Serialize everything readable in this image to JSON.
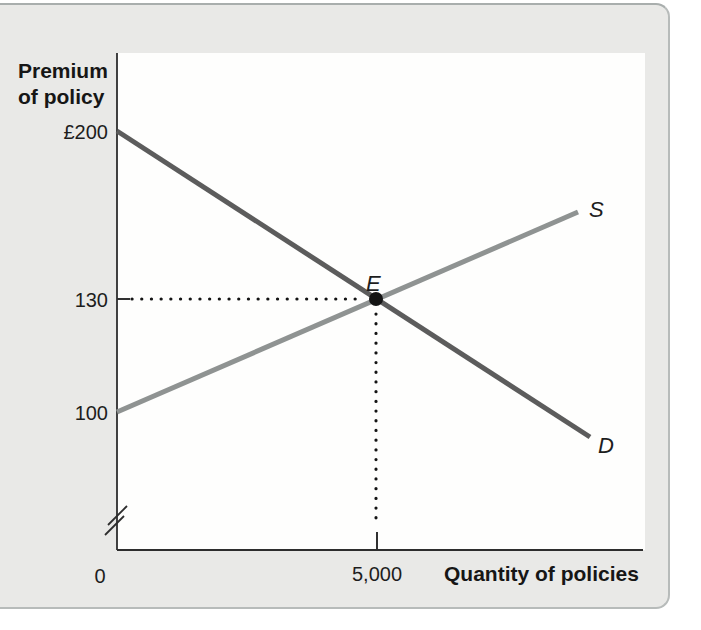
{
  "panel": {
    "background": "#e9e9e7",
    "border_color": "#b7bbba",
    "plot_background": "#fefefd"
  },
  "chart_data": {
    "type": "line",
    "title": "",
    "xlabel": "Quantity of policies",
    "ylabel_lines": [
      "Premium",
      "of policy"
    ],
    "x_ticks": [
      {
        "value": 0,
        "label": "0",
        "px": 117
      },
      {
        "value": 5000,
        "label": "5,000",
        "px": 377
      }
    ],
    "y_ticks": [
      {
        "value": 200,
        "label": "£200",
        "px": 131
      },
      {
        "value": 130,
        "label": "130",
        "px": 299
      },
      {
        "value": 100,
        "label": "100",
        "px": 412
      }
    ],
    "axis_break_y": true,
    "legend_position": "end-of-line-labels",
    "grid": false,
    "series": [
      {
        "name": "D",
        "role": "demand",
        "color": "#5c5c5c",
        "data_points": [
          [
            0,
            200
          ],
          [
            5000,
            130
          ]
        ],
        "px_line": [
          117,
          131,
          590,
          437
        ]
      },
      {
        "name": "S",
        "role": "supply",
        "color": "#8f9392",
        "data_points": [
          [
            0,
            100
          ],
          [
            5000,
            130
          ]
        ],
        "px_line": [
          117,
          412,
          578,
          212
        ]
      }
    ],
    "equilibrium": {
      "label": "E",
      "quantity": 5000,
      "premium": 130,
      "px": [
        376,
        299
      ],
      "dot_color": "#141414",
      "dot_radius": 7
    },
    "guides": {
      "h_dotted": [
        132,
        299,
        363,
        299
      ],
      "v_dotted": [
        376,
        314,
        376,
        527
      ],
      "solid_y_tick": [
        117,
        299,
        130,
        299
      ],
      "solid_x_tick": [
        377,
        532,
        377,
        550
      ],
      "break_marks": [
        [
          108,
          525,
          127,
          506
        ],
        [
          105,
          535,
          124,
          516
        ]
      ]
    },
    "axes": {
      "y_line": [
        117,
        53,
        117,
        550
      ],
      "x_line": [
        117,
        550,
        643,
        550
      ]
    }
  }
}
